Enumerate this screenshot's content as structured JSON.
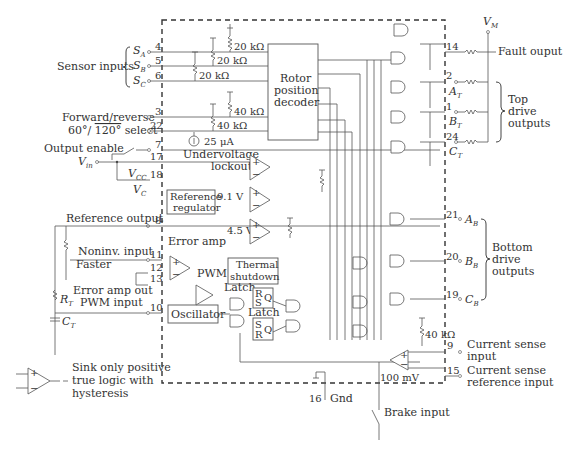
{
  "diagram": {
    "type": "block-schematic",
    "ic_boundary": "dashed",
    "blocks": {
      "rotor_decoder": [
        "Rotor",
        "position",
        "decoder"
      ],
      "undervoltage": [
        "Undervoltage",
        "lockout"
      ],
      "reference_regulator": [
        "Reference",
        "regulator"
      ],
      "error_amp": "Error amp",
      "pwm": "PWM",
      "thermal": [
        "Thermal",
        "shutdown"
      ],
      "latch1": "Latch",
      "latch2": "Latch",
      "oscillator": "Oscillator",
      "latch1_pins": [
        "R",
        "S",
        "Q"
      ],
      "latch2_pins": [
        "S",
        "R",
        "Q"
      ]
    },
    "values": {
      "r20k": "20 kΩ",
      "r40k": "40 kΩ",
      "i25": "25 μA",
      "v91": "9.1 V",
      "v45": "4.5 V",
      "mv100": "100 mV",
      "r40k_bottom": "40 kΩ"
    },
    "left_labels": {
      "sensor_inputs": "Sensor inputs",
      "sa": "S",
      "sa_sub": "A",
      "sb": "S",
      "sb_sub": "B",
      "sc": "S",
      "sc_sub": "C",
      "fwd_rev": "Forward/reverse",
      "select_60": "60°/ ",
      "select_120": "120°",
      "select_suffix": " select",
      "output_enable": "Output enable",
      "vin": "V",
      "vin_sub": "in",
      "vcc": "V",
      "vcc_sub": "CC",
      "vc": "V",
      "vc_sub": "C",
      "reference_output": "Reference output",
      "noninv_input": "Noninv. input",
      "faster": "Faster",
      "error_amp_out": "Error amp out",
      "pwm_input": "PWM input",
      "rt": "R",
      "rt_sub": "T",
      "ct": "C",
      "ct_sub": "T"
    },
    "pins": {
      "sa": "4",
      "sb": "5",
      "sc": "6",
      "fwd": "3",
      "sel": "22",
      "oe": "7",
      "vin": "17",
      "vcc": "18",
      "ref": "8",
      "noninv": "11",
      "p12": "12",
      "p13": "13",
      "osc": "10",
      "fault": "14",
      "at": "2",
      "bt": "1",
      "ct": "24",
      "ab": "21",
      "bb": "20",
      "cb": "19",
      "isense": "9",
      "iref": "15",
      "gnd": "16"
    },
    "right_labels": {
      "vm": "V",
      "vm_sub": "M",
      "fault_output": "Fault ouput",
      "at": "A",
      "at_sub": "T",
      "bt": "B",
      "bt_sub": "T",
      "ct": "C",
      "ct_sub": "T",
      "top_drive": [
        "Top",
        "drive",
        "outputs"
      ],
      "ab": "A",
      "ab_sub": "B",
      "bb": "B",
      "bb_sub": "B",
      "cb": "C",
      "cb_sub": "B",
      "bottom_drive": [
        "Bottom",
        "drive",
        "outputs"
      ],
      "current_sense_input": [
        "Current sense",
        "input"
      ],
      "current_sense_ref": [
        "Current sense",
        "reference input"
      ]
    },
    "bottom_labels": {
      "gnd": "Gnd",
      "brake_input": "Brake input"
    },
    "legend": {
      "text": [
        "Sink only positive",
        "true logic with",
        "hysteresis"
      ],
      "symbol": "comparator-with-hysteresis"
    }
  }
}
